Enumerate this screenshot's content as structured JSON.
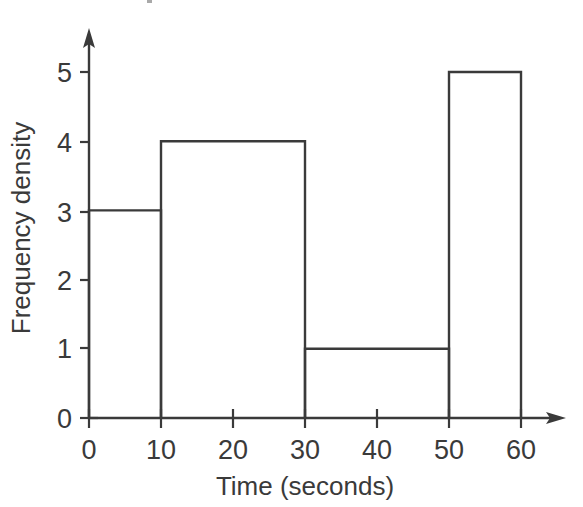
{
  "chart_data": {
    "type": "bar",
    "title": "",
    "subtitle": "",
    "xlabel": "Time (seconds)",
    "ylabel": "Frequency density",
    "xlim": [
      0,
      66
    ],
    "ylim": [
      0,
      5.6
    ],
    "grid": false,
    "legend": "none",
    "x_ticks": [
      "0",
      "10",
      "20",
      "30",
      "40",
      "50",
      "60"
    ],
    "x_tick_values": [
      0,
      10,
      20,
      30,
      40,
      50,
      60
    ],
    "y_ticks": [
      "0",
      "1",
      "2",
      "3",
      "4",
      "5"
    ],
    "y_tick_values": [
      0,
      1,
      2,
      3,
      4,
      5
    ],
    "bins": [
      {
        "label": "0-10",
        "x_start": 0,
        "x_end": 10,
        "frequency_density": 3,
        "frequency": 30
      },
      {
        "label": "10-30",
        "x_start": 10,
        "x_end": 30,
        "frequency_density": 4,
        "frequency": 80
      },
      {
        "label": "30-50",
        "x_start": 30,
        "x_end": 50,
        "frequency_density": 1,
        "frequency": 20
      },
      {
        "label": "50-60",
        "x_start": 50,
        "x_end": 60,
        "frequency_density": 5,
        "frequency": 50
      }
    ],
    "categories": [
      "0-10",
      "10-30",
      "30-50",
      "50-60"
    ],
    "values": [
      3,
      4,
      1,
      5
    ],
    "style": {
      "bar_fill": "none",
      "line_color": "#3a3a3a",
      "background": "#ffffff",
      "axis_arrows": true
    }
  },
  "axes": {
    "y_label": "Frequency density",
    "x_label": "Time (seconds)"
  }
}
